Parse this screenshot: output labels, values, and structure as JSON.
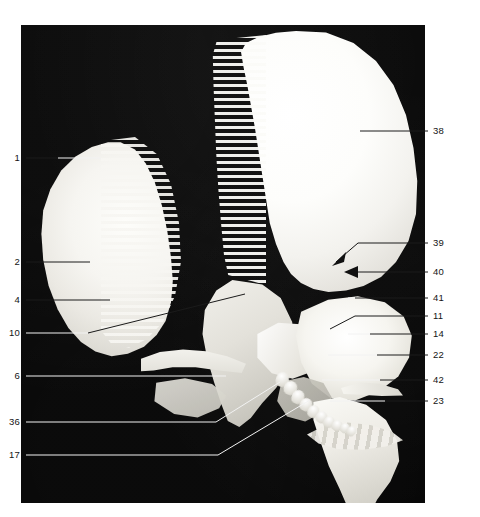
{
  "figure": {
    "type": "anatomical-photograph",
    "background_color": "#050505",
    "page_background": "#ffffff",
    "label_color": "#141414",
    "leader_line_color_on_photo": "#f2f2f2",
    "leader_line_color_on_page": "#1b1b1b"
  },
  "labels_left": [
    {
      "id": "1",
      "text": "1"
    },
    {
      "id": "2",
      "text": "2"
    },
    {
      "id": "4",
      "text": "4"
    },
    {
      "id": "10",
      "text": "10"
    },
    {
      "id": "6",
      "text": "6"
    },
    {
      "id": "36",
      "text": "36"
    },
    {
      "id": "17",
      "text": "17"
    }
  ],
  "labels_right": [
    {
      "id": "38",
      "text": "38"
    },
    {
      "id": "39",
      "text": "39"
    },
    {
      "id": "40",
      "text": "40"
    },
    {
      "id": "41",
      "text": "41"
    },
    {
      "id": "11",
      "text": "11"
    },
    {
      "id": "14",
      "text": "14"
    },
    {
      "id": "22",
      "text": "22"
    },
    {
      "id": "42",
      "text": "42"
    },
    {
      "id": "23",
      "text": "23"
    }
  ],
  "arrows": [
    {
      "id": "arrow-39",
      "points_to": "bent leader from label 39, arrowhead down-left"
    },
    {
      "id": "arrow-40",
      "points_to": "straight leader from label 40, arrowhead left"
    }
  ]
}
